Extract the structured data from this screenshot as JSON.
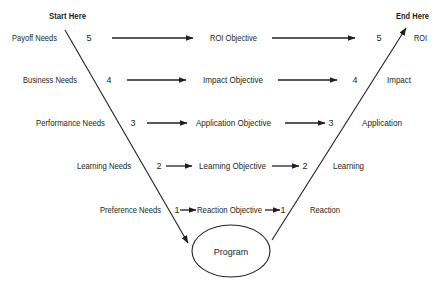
{
  "diagram": {
    "start_label": "Start Here",
    "end_label": "End Here",
    "center_node": "Program",
    "rows": [
      {
        "level": "5",
        "need": "Payoff Needs",
        "objective": "ROI Objective",
        "evaluation": "ROI"
      },
      {
        "level": "4",
        "need": "Business Needs",
        "objective": "Impact Objective",
        "evaluation": "Impact"
      },
      {
        "level": "3",
        "need": "Performance Needs",
        "objective": "Application Objective",
        "evaluation": "Application"
      },
      {
        "level": "2",
        "need": "Learning Needs",
        "objective": "Learning Objective",
        "evaluation": "Learning"
      },
      {
        "level": "1",
        "need": "Preference Needs",
        "objective": "Reaction Objective",
        "evaluation": "Reaction"
      }
    ],
    "colors": {
      "ink": "#231f20",
      "background": "#ffffff"
    }
  }
}
